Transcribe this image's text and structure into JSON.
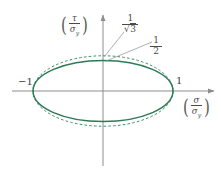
{
  "figure": {
    "title": "",
    "background_color": "#ffffff",
    "width": 221,
    "height": 174
  },
  "axes": {
    "x_axis": {
      "label_num": "σ",
      "label_den": "σ",
      "label_den_sub": "y",
      "color": "#8a8a8a",
      "arrow": "right-arrow-icon"
    },
    "y_axis": {
      "label_num": "τ",
      "label_den": "σ",
      "label_den_sub": "y",
      "color": "#8a8a8a",
      "arrow": "up-arrow-icon"
    },
    "ticks": {
      "x_left": "−1",
      "x_right": "1"
    }
  },
  "annotations": {
    "sqrt3": {
      "numerator": "1",
      "radical": "√",
      "radicand": "3"
    },
    "half": {
      "numerator": "1",
      "denominator": "2"
    }
  },
  "colors": {
    "curve_solid": "#2f7a56",
    "curve_dashed": "#3f8a66",
    "axis": "#8d8d8d",
    "text": "#3f3f3f"
  },
  "chart_data": {
    "type": "line",
    "title": "",
    "xlabel": "σ/σ_y",
    "ylabel": "τ/σ_y",
    "xlim": [
      -1.45,
      1.6
    ],
    "ylim": [
      -1.28,
      1.1
    ],
    "grid": false,
    "legend": null,
    "annotations": [
      {
        "text": "1/√3",
        "value": 0.5774,
        "points_to": "dashed-ellipse-apex",
        "meaning": "von Mises shear yield ratio"
      },
      {
        "text": "1/2",
        "value": 0.5,
        "points_to": "solid-ellipse-apex",
        "meaning": "Tresca shear yield ratio"
      },
      {
        "text": "−1",
        "value": -1,
        "axis": "x"
      },
      {
        "text": "1",
        "value": 1,
        "axis": "x"
      }
    ],
    "series": [
      {
        "name": "Tresca ellipse (solid)",
        "style": "solid",
        "color": "#2f7a56",
        "shape": "ellipse",
        "center": [
          0,
          0
        ],
        "semi_major_x": 1.0,
        "semi_minor_y": 0.5,
        "equation": "(σ/σ_y)^2 + (τ/(0.5σ_y))^2 = 1"
      },
      {
        "name": "von Mises ellipse (dashed)",
        "style": "dashed",
        "color": "#3f8a66",
        "shape": "ellipse",
        "center": [
          0,
          0
        ],
        "semi_major_x": 1.0,
        "semi_minor_y": 0.5774,
        "equation": "(σ/σ_y)^2 + 3(τ/σ_y)^2 = 1"
      }
    ]
  }
}
